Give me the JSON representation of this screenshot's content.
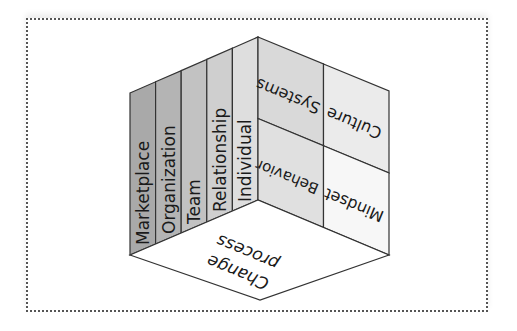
{
  "diagram": {
    "left_face": {
      "columns": [
        {
          "label": "Marketplace",
          "fill": "#a9a9a9"
        },
        {
          "label": "Organization",
          "fill": "#b4b4b4"
        },
        {
          "label": "Team",
          "fill": "#c2c2c2"
        },
        {
          "label": "Relationship",
          "fill": "#cfcfcf"
        },
        {
          "label": "Individual",
          "fill": "#dedede"
        }
      ]
    },
    "right_face": {
      "cells": [
        {
          "label": "Systems",
          "fill": "#d9d9d9"
        },
        {
          "label": "Culture",
          "fill": "#ebebeb"
        },
        {
          "label": "Behavior",
          "fill": "#e0e0e0"
        },
        {
          "label": "Mindset",
          "fill": "#f7f7f7"
        }
      ]
    },
    "bottom_face": {
      "line1": "Change",
      "line2": "process",
      "fill": "#ffffff"
    }
  }
}
